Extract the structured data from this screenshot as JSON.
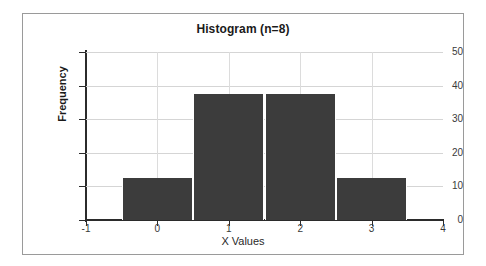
{
  "panel": {
    "border_color": "#9a9a9a",
    "background": "#ffffff"
  },
  "chart_data": {
    "type": "bar",
    "title": "Histogram (n=8)",
    "xlabel": "X Values",
    "ylabel": "Frequency",
    "bar_color": "#3c3c3c",
    "gridline_color": "#d5d5d5",
    "axis_color": "#2b2b2b",
    "grid": true,
    "legend": null,
    "xlim": [
      -1,
      4
    ],
    "ylim": [
      0,
      50
    ],
    "x_ticks": [
      -1,
      0,
      1,
      2,
      3,
      4
    ],
    "x_tick_labels": [
      "-1",
      "0",
      "1",
      "2",
      "3",
      "4"
    ],
    "y_ticks": [
      0,
      10,
      20,
      30,
      40,
      50
    ],
    "y_tick_labels": [
      "0",
      "10",
      "20",
      "30",
      "40",
      "50"
    ],
    "bins": [
      {
        "label": "0",
        "bin_start": -0.5,
        "bin_end": 0.5,
        "value": 12.5
      },
      {
        "label": "1",
        "bin_start": 0.5,
        "bin_end": 1.5,
        "value": 37.5
      },
      {
        "label": "2",
        "bin_start": 1.5,
        "bin_end": 2.5,
        "value": 37.5
      },
      {
        "label": "3",
        "bin_start": 2.5,
        "bin_end": 3.5,
        "value": 12.5
      }
    ],
    "categories": [
      "0",
      "1",
      "2",
      "3"
    ],
    "values": [
      12.5,
      37.5,
      37.5,
      12.5
    ],
    "sample_size": 8
  }
}
